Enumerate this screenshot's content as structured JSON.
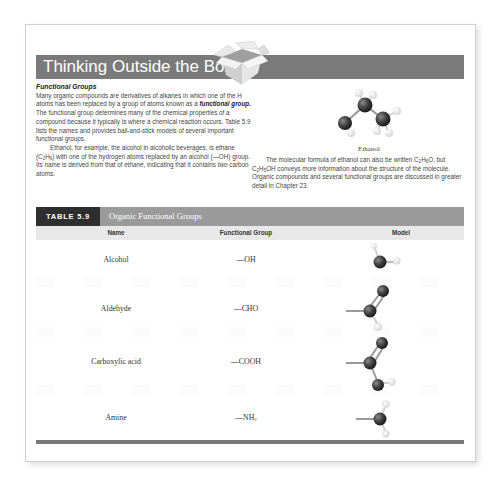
{
  "banner": {
    "title": "Thinking Outside the Box",
    "icon": "open-box-icon"
  },
  "left_column": {
    "subhead": "Functional Groups",
    "p1_a": "Many organic compounds are derivatives of alkanes in which one of the H atoms has been replaced by a group of atoms known as a ",
    "p1_term": "functional group.",
    "p1_b": " The functional group determines many of the chemical properties of a compound because it typically is where a chemical reaction occurs. Table 5.9 lists the names and provides ball-and-stick models of several important functional groups.",
    "p2_a": "Ethanol, for example, the alcohol in alcoholic beverages, is ethane (C",
    "p2_sub1": "2",
    "p2_b": "H",
    "p2_sub2": "6",
    "p2_c": ") with one of the hydrogen atoms replaced by an alcohol (—OH) group. Its name is derived from that of ",
    "p2_it1": "ethane",
    "p2_d": ", indicating that it contains ",
    "p2_it2": "two",
    "p2_e": " carbon atoms."
  },
  "figure": {
    "caption": "Ethanol",
    "model_icon": "ethanol-molecule-icon"
  },
  "right_column": {
    "a": "The molecular formula of ethanol can also be written C",
    "sub1": "2",
    "b": "H",
    "sub2": "6",
    "c": "O, but C",
    "sub3": "2",
    "d": "H",
    "sub4": "5",
    "e": "OH conveys more information about the structure of the molecule. Organic compounds and several functional groups are discussed in greater detail in Chapter 23."
  },
  "table": {
    "badge": "TABLE 5.9",
    "title": "Organic Functional Groups",
    "columns": [
      "Name",
      "Functional Group",
      "Model"
    ],
    "rows": [
      {
        "name": "Alcohol",
        "group": "—OH",
        "group_sub": "",
        "model": "alcohol-model-icon"
      },
      {
        "name": "Aldehyde",
        "group": "—CHO",
        "group_sub": "",
        "model": "aldehyde-model-icon"
      },
      {
        "name": "Carboxylic acid",
        "group": "—COOH",
        "group_sub": "",
        "model": "carboxylic-acid-model-icon"
      },
      {
        "name": "Amine",
        "group": "—NH",
        "group_sub": "2",
        "model": "amine-model-icon"
      }
    ]
  },
  "colors": {
    "banner_bg": "#7a7a7a",
    "badge_bg": "#2e2e2e",
    "table_title_bg": "#9a9a9a",
    "column_header_bg": "#e8e8e8",
    "carbon_atom": "#3c3c3c",
    "hydrogen_atom": "#f2f2f2"
  }
}
